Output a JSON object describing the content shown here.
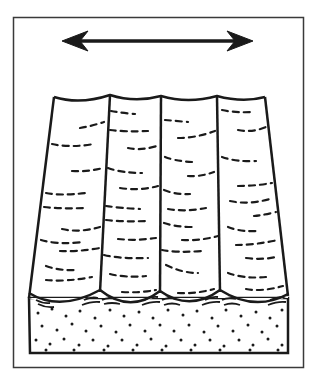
{
  "figure": {
    "type": "geologic-block-diagram",
    "colors": {
      "ink": "#1a1a1a",
      "paper": "#ffffff",
      "frame": "#3a3a3a"
    },
    "elements": {
      "arrow": {
        "icon": "double-headed-arrow",
        "meaning": "flow/current direction axis"
      },
      "troughs": {
        "count": 4,
        "meaning": "trough-shaped cross-bedded sets"
      },
      "sand_base": {
        "pattern": "stippled dots",
        "meaning": "underlying sand layer"
      }
    }
  }
}
